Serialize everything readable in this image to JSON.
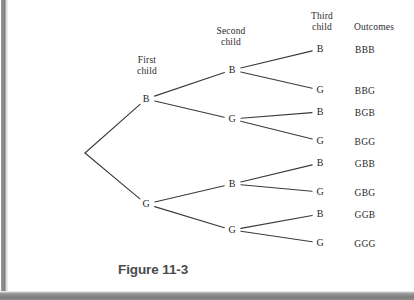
{
  "figure": {
    "caption": "Figure 11-3"
  },
  "column_headers": [
    {
      "name": "first-child",
      "line1": "First",
      "line2": "child",
      "x": 127,
      "y": 55
    },
    {
      "name": "second-child",
      "line1": "Second",
      "line2": "child",
      "x": 207,
      "y": 26
    },
    {
      "name": "third-child",
      "line1": "Third",
      "line2": "child",
      "x": 303,
      "y": 11
    },
    {
      "name": "outcomes",
      "line1": "Outcomes",
      "line2": "",
      "x": 348,
      "y": 22
    }
  ],
  "chart_data": {
    "type": "diagram",
    "diagram_kind": "probability-tree",
    "title": "Figure 11-3",
    "stages": [
      "First child",
      "Second child",
      "Third child",
      "Outcomes"
    ],
    "branch_labels": [
      "B",
      "G"
    ],
    "root": {
      "x": 85,
      "y": 153
    },
    "nodes": [
      {
        "id": "n1-B",
        "label": "B",
        "stage": 1,
        "x": 146,
        "y": 99
      },
      {
        "id": "n1-G",
        "label": "G",
        "stage": 1,
        "x": 146,
        "y": 204
      },
      {
        "id": "n2-BB",
        "label": "B",
        "stage": 2,
        "x": 232,
        "y": 70
      },
      {
        "id": "n2-BG",
        "label": "G",
        "stage": 2,
        "x": 232,
        "y": 119
      },
      {
        "id": "n2-GB",
        "label": "B",
        "stage": 2,
        "x": 232,
        "y": 184
      },
      {
        "id": "n2-GG",
        "label": "G",
        "stage": 2,
        "x": 232,
        "y": 230
      },
      {
        "id": "n3-BBB",
        "label": "B",
        "stage": 3,
        "x": 320,
        "y": 49
      },
      {
        "id": "n3-BBG",
        "label": "G",
        "stage": 3,
        "x": 320,
        "y": 90
      },
      {
        "id": "n3-BGB",
        "label": "B",
        "stage": 3,
        "x": 320,
        "y": 112
      },
      {
        "id": "n3-BGG",
        "label": "G",
        "stage": 3,
        "x": 320,
        "y": 141
      },
      {
        "id": "n3-GBB",
        "label": "B",
        "stage": 3,
        "x": 320,
        "y": 163
      },
      {
        "id": "n3-GBG",
        "label": "G",
        "stage": 3,
        "x": 320,
        "y": 192
      },
      {
        "id": "n3-GGB",
        "label": "B",
        "stage": 3,
        "x": 320,
        "y": 214
      },
      {
        "id": "n3-GGG",
        "label": "G",
        "stage": 3,
        "x": 320,
        "y": 243
      }
    ],
    "edges": [
      {
        "from": "root",
        "to": "n1-B"
      },
      {
        "from": "root",
        "to": "n1-G"
      },
      {
        "from": "n1-B",
        "to": "n2-BB"
      },
      {
        "from": "n1-B",
        "to": "n2-BG"
      },
      {
        "from": "n1-G",
        "to": "n2-GB"
      },
      {
        "from": "n1-G",
        "to": "n2-GG"
      },
      {
        "from": "n2-BB",
        "to": "n3-BBB"
      },
      {
        "from": "n2-BB",
        "to": "n3-BBG"
      },
      {
        "from": "n2-BG",
        "to": "n3-BGB"
      },
      {
        "from": "n2-BG",
        "to": "n3-BGG"
      },
      {
        "from": "n2-GB",
        "to": "n3-GBB"
      },
      {
        "from": "n2-GB",
        "to": "n3-GBG"
      },
      {
        "from": "n2-GG",
        "to": "n3-GGB"
      },
      {
        "from": "n2-GG",
        "to": "n3-GGG"
      }
    ],
    "outcomes": [
      {
        "label": "BBB",
        "x": 365,
        "y": 45
      },
      {
        "label": "BBG",
        "x": 365,
        "y": 86
      },
      {
        "label": "BGB",
        "x": 365,
        "y": 108
      },
      {
        "label": "BGG",
        "x": 365,
        "y": 137
      },
      {
        "label": "GBB",
        "x": 365,
        "y": 159
      },
      {
        "label": "GBG",
        "x": 365,
        "y": 188
      },
      {
        "label": "GGB",
        "x": 365,
        "y": 210
      },
      {
        "label": "GGG",
        "x": 365,
        "y": 239
      }
    ],
    "line_color": "#3a3a3a",
    "text_color": "#262626",
    "background_color": "#ffffff",
    "frame_color": "#7d7d7d"
  }
}
